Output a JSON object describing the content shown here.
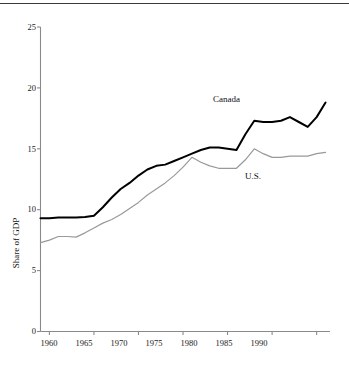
{
  "figure": {
    "has_top_rule": true,
    "background_color": "#ffffff"
  },
  "chart_data": {
    "type": "line",
    "title": "",
    "subtitle": "",
    "xlabel": "",
    "ylabel": "Share of GDP",
    "xlim": [
      1959,
      1991.5
    ],
    "ylim": [
      0,
      25
    ],
    "xticks": [
      "1960",
      "1965",
      "1970",
      "1975",
      "1980",
      "1985",
      "1990"
    ],
    "xtick_values": [
      1960,
      1965,
      1970,
      1975,
      1980,
      1985,
      1990
    ],
    "yticks": [
      "0",
      "5",
      "10",
      "15",
      "20",
      "25"
    ],
    "ytick_values": [
      0,
      5,
      10,
      15,
      20,
      25
    ],
    "grid": false,
    "legend_position": "inline-annotation",
    "x": [
      1959,
      1960,
      1961,
      1962,
      1963,
      1964,
      1965,
      1966,
      1967,
      1968,
      1969,
      1970,
      1971,
      1972,
      1973,
      1974,
      1975,
      1976,
      1977,
      1978,
      1979,
      1980,
      1981,
      1982,
      1983,
      1984,
      1985,
      1986,
      1987,
      1988,
      1989,
      1990,
      1991
    ],
    "series": [
      {
        "name": "Canada",
        "color": "#000000",
        "line_width": 2.0,
        "label_text": "Canada",
        "values": [
          9.3,
          9.3,
          9.35,
          9.35,
          9.35,
          9.4,
          9.5,
          10.2,
          11.0,
          11.7,
          12.2,
          12.8,
          13.3,
          13.6,
          13.7,
          14.0,
          14.3,
          14.6,
          14.9,
          15.1,
          15.1,
          15.0,
          14.9,
          16.2,
          17.3,
          17.2,
          17.2,
          17.3,
          17.6,
          17.2,
          16.8,
          17.6,
          18.8
        ]
      },
      {
        "name": "U.S.",
        "color": "#999999",
        "line_width": 1.2,
        "label_text": "U.S.",
        "values": [
          7.3,
          7.5,
          7.8,
          7.8,
          7.75,
          8.1,
          8.5,
          8.9,
          9.2,
          9.6,
          10.1,
          10.6,
          11.2,
          11.7,
          12.2,
          12.8,
          13.5,
          14.3,
          13.9,
          13.6,
          13.4,
          13.4,
          13.4,
          14.1,
          15.0,
          14.6,
          14.3,
          14.3,
          14.4,
          14.4,
          14.4,
          14.6,
          14.7
        ]
      }
    ],
    "annotations": [
      {
        "text": "Canada",
        "x_px": 213,
        "y_px": 100
      },
      {
        "text": "U.S.",
        "x_px": 245,
        "y_px": 177
      }
    ]
  }
}
